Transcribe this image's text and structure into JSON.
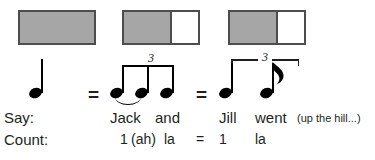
{
  "diagram": {
    "colors": {
      "fill_gray": "#a6a6a6",
      "border_gray": "#4d4d4d",
      "ink": "#231f20",
      "note_black": "#000000",
      "background": "#ffffff"
    }
  },
  "boxes": [
    {
      "id": "box-1",
      "name": "whole-beat-box",
      "segments": [
        {
          "fill": "gray",
          "fraction": "1"
        }
      ]
    },
    {
      "id": "box-2",
      "name": "two-thirds-one-third-box",
      "segments": [
        {
          "fill": "gray",
          "fraction": "2/3"
        },
        {
          "fill": "white",
          "fraction": "1/3"
        }
      ]
    },
    {
      "id": "box-3",
      "name": "two-thirds-one-third-box",
      "segments": [
        {
          "fill": "gray",
          "fraction": "2/3"
        },
        {
          "fill": "white",
          "fraction": "1/3"
        }
      ]
    }
  ],
  "notation": {
    "group_1": {
      "name": "quarter-note",
      "notes": [
        {
          "type": "quarter",
          "stem": "up"
        }
      ]
    },
    "equals_1": "=",
    "group_2": {
      "name": "beamed-eighth-note-triplet",
      "tuplet_number": "3",
      "beam": "single",
      "tie": "notes-1-2",
      "notes": [
        {
          "type": "eighth",
          "stem": "up"
        },
        {
          "type": "eighth",
          "stem": "up"
        },
        {
          "type": "eighth",
          "stem": "up"
        }
      ]
    },
    "equals_2": "=",
    "group_3": {
      "name": "quarter-eighth-triplet",
      "tuplet_number": "3",
      "bracket": "square",
      "notes": [
        {
          "type": "quarter",
          "stem": "up"
        },
        {
          "type": "eighth",
          "stem": "up",
          "flag": true
        }
      ]
    }
  },
  "rows": {
    "say": {
      "label": "Say:",
      "group_2_words": [
        "Jack",
        "and"
      ],
      "group_3_words": [
        "Jill",
        "went"
      ],
      "trailing_note": "(up the hill...)"
    },
    "count": {
      "label": "Count:",
      "group_2_syllables": [
        "1",
        "(ah)",
        "la"
      ],
      "equals": "=",
      "group_3_syllables": [
        "1",
        "la"
      ]
    }
  }
}
